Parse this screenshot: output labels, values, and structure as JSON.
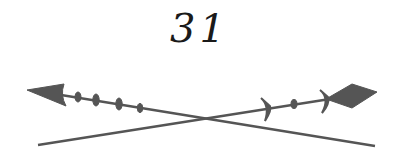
{
  "page_number": "31",
  "ornament": {
    "description": "crossed-arrows-divider",
    "color": "#555555",
    "left_arrow": {
      "head": "triangle",
      "tip": [
        27,
        90
      ],
      "tail": [
        375,
        146
      ]
    },
    "right_arrow": {
      "head": "diamond",
      "tip": [
        377,
        92
      ],
      "tail": [
        38,
        145
      ]
    }
  }
}
